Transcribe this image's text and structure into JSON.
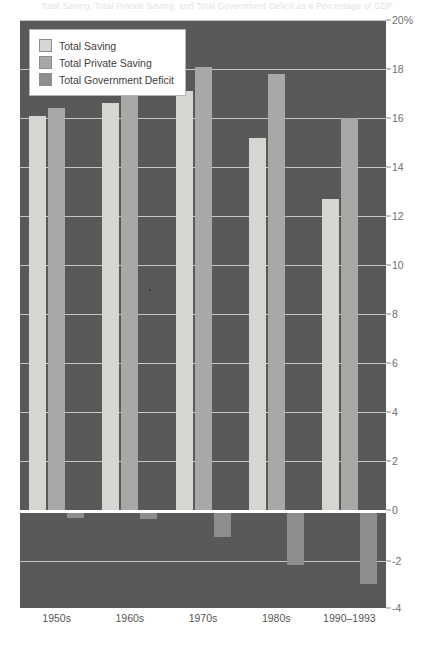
{
  "title_strip": "Total Saving, Total Private Saving, and Total Government Deficit as a Percentage of GDP",
  "legend": {
    "items": [
      {
        "label": "Total Saving",
        "color": "#d5d5d2",
        "key": "total_saving"
      },
      {
        "label": "Total Private Saving",
        "color": "#a8a9a6",
        "key": "total_private_saving"
      },
      {
        "label": "Total Government Deficit",
        "color": "#8d8e8b",
        "key": "total_government_deficit"
      }
    ]
  },
  "axis": {
    "y_ticks": [
      "20%",
      "18",
      "16",
      "14",
      "12",
      "10",
      "8",
      "6",
      "4",
      "2",
      "0",
      "-2",
      "-4"
    ],
    "y_tick_values": [
      20,
      18,
      16,
      14,
      12,
      10,
      8,
      6,
      4,
      2,
      0,
      -2,
      -4
    ],
    "y_min": -4,
    "y_max": 20,
    "y_unit": "%"
  },
  "chart_data": {
    "type": "bar",
    "title": "Total Saving, Total Private Saving, and Total Government Deficit as a Percentage of GDP",
    "xlabel": "",
    "ylabel": "",
    "ylim": [
      -4,
      20
    ],
    "grid": true,
    "legend_position": "top-left",
    "categories": [
      "1950s",
      "1960s",
      "1970s",
      "1980s",
      "1990–1993"
    ],
    "series": [
      {
        "name": "Total Saving",
        "color": "#d5d5d2",
        "values": [
          16.1,
          16.6,
          17.1,
          15.2,
          12.7
        ]
      },
      {
        "name": "Total Private Saving",
        "color": "#a8a9a6",
        "values": [
          16.4,
          17.0,
          18.1,
          17.8,
          16.0
        ]
      },
      {
        "name": "Total Government Deficit",
        "color": "#8d8e8b",
        "values": [
          -0.2,
          -0.25,
          -1.0,
          -2.2,
          -3.0
        ]
      }
    ]
  },
  "colors": {
    "plot_background": "#595959",
    "gridline": "#d9d9d9",
    "page_background": "#ffffff",
    "tick_text": "#6e6e6e"
  }
}
